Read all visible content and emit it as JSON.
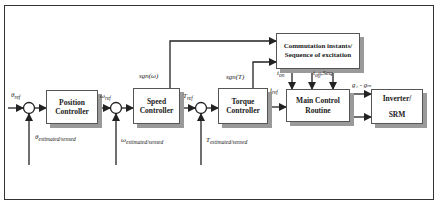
{
  "diagram": {
    "type": "control-block-diagram",
    "blocks": {
      "position_controller": {
        "line1": "Position",
        "line2": "Controller"
      },
      "speed_controller": {
        "line1": "Speed",
        "line2": "Controller"
      },
      "torque_controller": {
        "line1": "Torque",
        "line2": "Controller"
      },
      "commutation": {
        "line1": "Commutation instants/",
        "line2": "Sequence of excitation"
      },
      "main_control": {
        "line1": "Main Control",
        "line2": "Routine"
      },
      "inverter": {
        "line1": "Inverter/",
        "line2": "SRM"
      }
    },
    "signals": {
      "theta_ref": {
        "sym": "θ",
        "sub": "ref"
      },
      "omega_ref": {
        "sym": "ω",
        "sub": "ref"
      },
      "t_ref": {
        "sym": "T",
        "sub": "ref"
      },
      "i_ref": {
        "sym": "i",
        "sub": "ref"
      },
      "sgn_omega": "sgn(ω)",
      "sgn_t": "sgn(T)",
      "t_on": {
        "sym": "t",
        "sub": "on"
      },
      "t_off_seq": {
        "sym": "t",
        "sub": "off",
        "rest": ",Seq"
      },
      "gates": "g₁ - gₘ",
      "theta_fb": {
        "sym": "θ",
        "sub": "estimated/sensed"
      },
      "omega_fb": {
        "sym": "ω",
        "sub": "estimated/sensed"
      },
      "t_fb": {
        "sym": "T",
        "sub": "estimated/sensed"
      }
    },
    "colors": {
      "line": "#222222",
      "shadow": "#9a9a9a",
      "border": "#555555"
    }
  }
}
